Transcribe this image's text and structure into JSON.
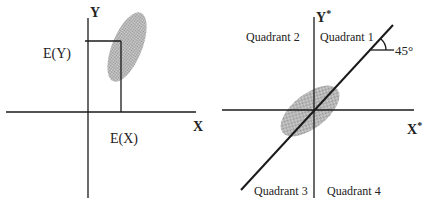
{
  "diagram": {
    "left_panel": {
      "y_axis_label": "Y",
      "x_axis_label": "X",
      "expected_y_label": "E(Y)",
      "expected_x_label": "E(X)"
    },
    "right_panel": {
      "y_axis_label": "Y",
      "y_axis_superscript": "*",
      "x_axis_label": "X",
      "x_axis_superscript": "*",
      "quadrants": [
        "Quadrant 1",
        "Quadrant 2",
        "Quadrant 3",
        "Quadrant 4"
      ],
      "angle_label": "45°"
    },
    "colors": {
      "axis": "#1a1a1a",
      "ellipse_fill": "#b8b8b8"
    }
  }
}
